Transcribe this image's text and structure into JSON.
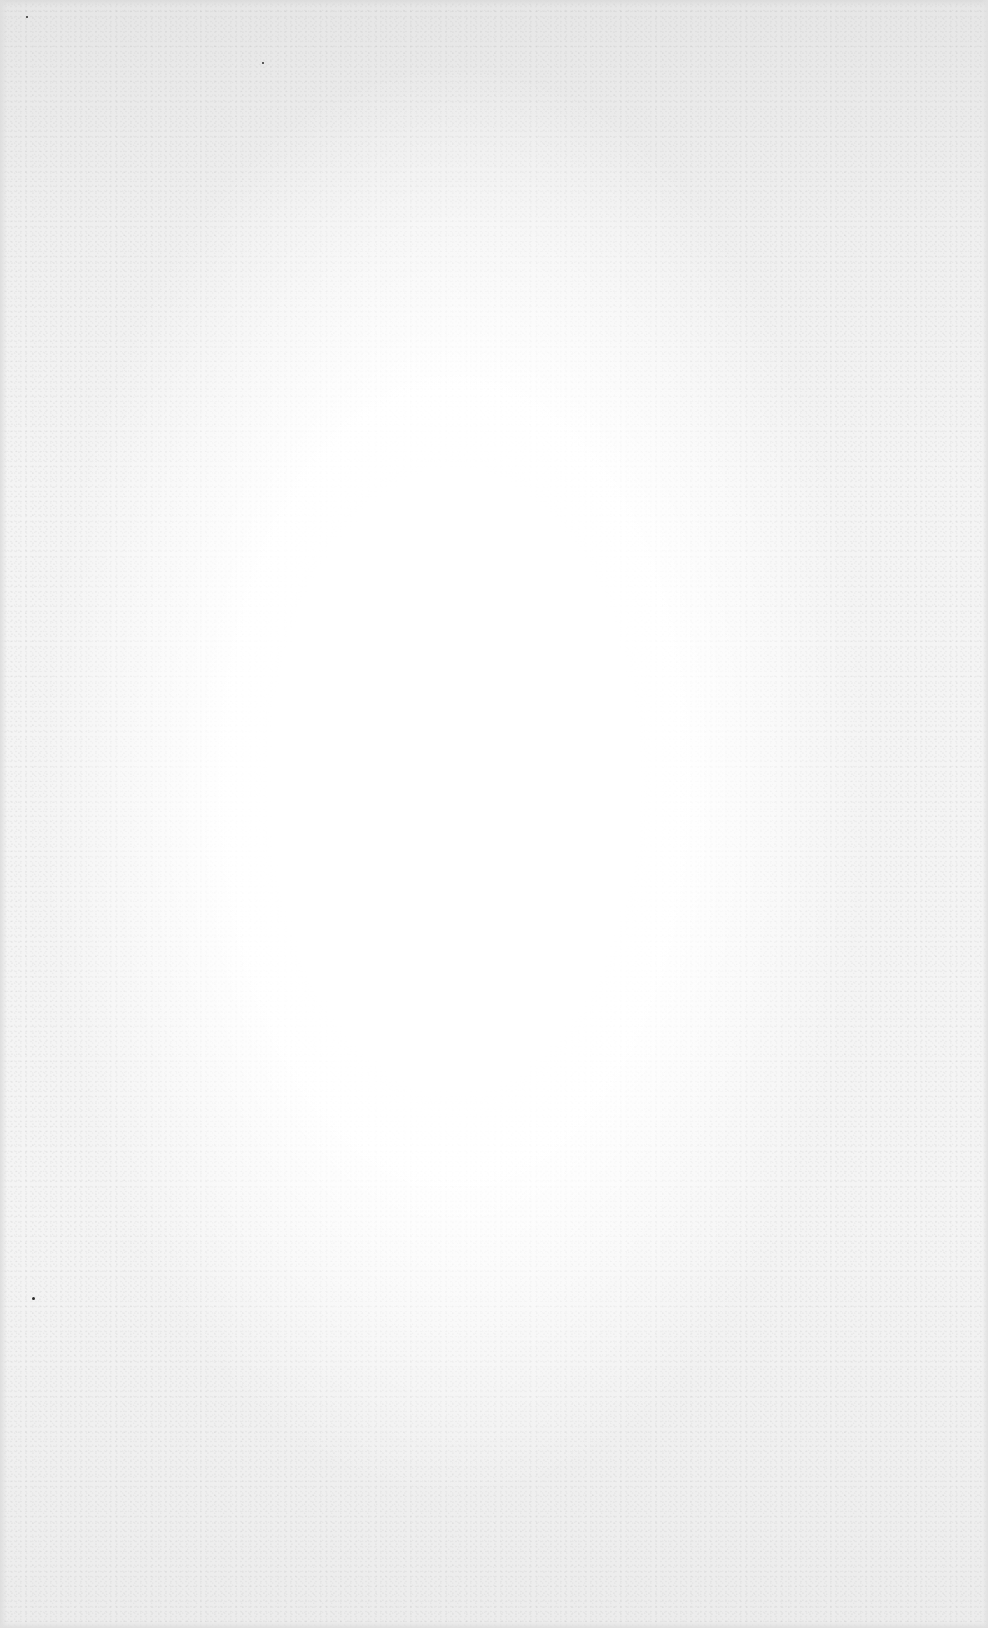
{
  "document": {
    "type": "blank-page",
    "background_color": "#f4f4f4",
    "center_color": "#ffffff",
    "edge_color": "#e2e2e2",
    "text_content": "",
    "specks": [
      {
        "x": 26,
        "y": 16,
        "size": 2
      },
      {
        "x": 262,
        "y": 62,
        "size": 2
      },
      {
        "x": 32,
        "y": 1297,
        "size": 3
      }
    ]
  }
}
